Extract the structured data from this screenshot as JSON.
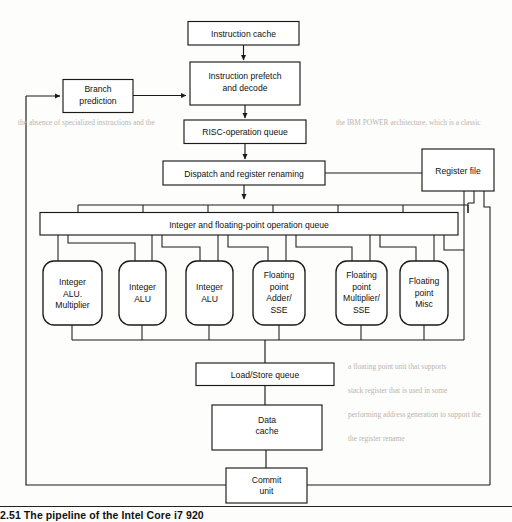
{
  "figure": {
    "type": "block-diagram",
    "caption": "2.51  The pipeline of the Intel Core i7 920"
  },
  "blocks": {
    "instruction_cache": "Instruction cache",
    "branch_prediction_l1": "Branch",
    "branch_prediction_l2": "prediction",
    "prefetch_l1": "Instruction prefetch",
    "prefetch_l2": "and decode",
    "risc_queue": "RISC-operation queue",
    "dispatch": "Dispatch and register renaming",
    "register_file": "Register file",
    "op_queue": "Integer and floating-point operation queue",
    "load_store_queue": "Load/Store queue",
    "data_cache_l1": "Data",
    "data_cache_l2": "cache",
    "commit_l1": "Commit",
    "commit_l2": "unit"
  },
  "units": [
    {
      "lines": [
        "Integer",
        "ALU.",
        "Multiplier"
      ]
    },
    {
      "lines": [
        "Integer",
        "ALU"
      ]
    },
    {
      "lines": [
        "Integer",
        "ALU"
      ]
    },
    {
      "lines": [
        "Floating",
        "point",
        "Adder/",
        "SSE"
      ]
    },
    {
      "lines": [
        "Floating",
        "point",
        "Multiplier/",
        "SSE"
      ]
    },
    {
      "lines": [
        "Floating",
        "point",
        "Misc"
      ]
    }
  ],
  "colors": {
    "page_background": "#fdfdfc",
    "stroke": "#1a1a1a",
    "text": "#111111",
    "bleed_through_text": "#b9b5ad"
  },
  "bleed_through": [
    "the absence of specialized instructions and the",
    "the IBM POWER architecture, which is a classic",
    "a floating point unit that supports",
    "stack register that is used in some",
    "performing address generation to support the",
    "the register rename"
  ]
}
